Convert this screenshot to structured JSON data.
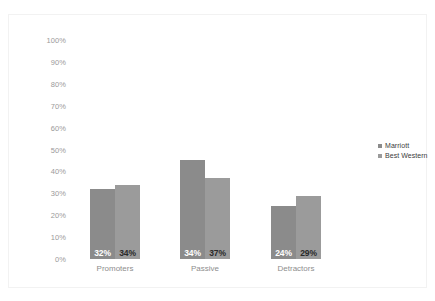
{
  "chart_data": {
    "type": "bar",
    "title": "",
    "subtitle": "",
    "xlabel": "",
    "ylabel": "",
    "categories": [
      "Promoters",
      "Passive",
      "Detractors"
    ],
    "series": [
      {
        "name": "Marriott",
        "color": "#8b8b8b",
        "values": [
          32,
          45,
          24
        ],
        "labels": [
          "32%",
          "34%",
          "24%"
        ]
      },
      {
        "name": "Best Western",
        "color": "#9b9b9b",
        "values": [
          34,
          37,
          29
        ],
        "labels": [
          "34%",
          "37%",
          "29%"
        ]
      }
    ],
    "ylim": [
      0,
      100
    ],
    "y_ticks": [
      100,
      90,
      80,
      70,
      60,
      50,
      40,
      30,
      20,
      10,
      0
    ],
    "y_tick_labels": [
      "100%",
      "90%",
      "80%",
      "70%",
      "60%",
      "50%",
      "40%",
      "30%",
      "20%",
      "10%",
      "0%"
    ],
    "grid": false,
    "legend_position": "right",
    "data_labels_shown": true
  },
  "axis": {
    "y_tick_labels": [
      "100%",
      "90%",
      "80%",
      "70%",
      "60%",
      "50%",
      "40%",
      "30%",
      "20%",
      "10%",
      "0%"
    ],
    "x_categories": [
      "Promoters",
      "Passive",
      "Detractors"
    ]
  },
  "bars": {
    "promoters": {
      "marriott": "32%",
      "best_western": "34%"
    },
    "passive": {
      "marriott": "45%",
      "best_western": "37%"
    },
    "detractors": {
      "marriott": "24%",
      "best_western": "29%"
    }
  },
  "legend": {
    "items": [
      {
        "label": "Marriott"
      },
      {
        "label": "Best Western"
      }
    ]
  },
  "colors": {
    "series_marriott": "#8b8b8b",
    "series_best_western": "#9b9b9b",
    "axis_text": "#9a9a9a",
    "category_text": "#8e8e8e",
    "legend_text": "#3c3c3c",
    "background": "#ffffff",
    "frame": "#f2f2f2"
  }
}
